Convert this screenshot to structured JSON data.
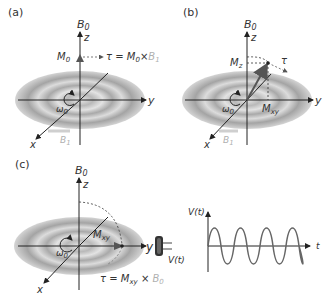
{
  "panels": {
    "a": {
      "label": "(a)",
      "axis_b0": "B",
      "axis_b0_sub": "0",
      "axis_z": "z",
      "axis_y": "y",
      "axis_x": "x",
      "omega": "ω",
      "omega_sub": "0",
      "vector_m": "M",
      "vector_m_sub": "0",
      "torque_eq": "τ = ",
      "torque_m": "M",
      "torque_m_sub": "0",
      "times": "×",
      "torque_b": "B",
      "torque_b_sub": "1",
      "b1": "B",
      "b1_sub": "1"
    },
    "b": {
      "label": "(b)",
      "axis_b0": "B",
      "axis_b0_sub": "0",
      "axis_z": "z",
      "axis_y": "y",
      "axis_x": "x",
      "omega": "ω",
      "omega_sub": "0",
      "mz": "M",
      "mz_sub": "z",
      "mxy": "M",
      "mxy_sub": "xy",
      "tau": "τ",
      "b1": "B",
      "b1_sub": "1"
    },
    "c": {
      "label": "(c)",
      "axis_b0": "B",
      "axis_b0_sub": "0",
      "axis_z": "z",
      "axis_y": "y",
      "axis_x": "x",
      "omega": "ω",
      "omega_sub": "0",
      "mxy": "M",
      "mxy_sub": "xy",
      "torque_eq": "τ = ",
      "torque_m": "M",
      "torque_m_sub": "xy",
      "times": "×",
      "torque_b": "B",
      "torque_b_sub": "0",
      "coil_label": "V(t)"
    },
    "signal": {
      "ylabel": "V(t)",
      "xlabel": "t",
      "cycles": 4
    }
  },
  "colors": {
    "axis": "#222222",
    "disk_dark": "#9a9a9a",
    "disk_light": "#e6e6e6",
    "faded_label": "#b5b5b5",
    "wave": "#666666"
  }
}
